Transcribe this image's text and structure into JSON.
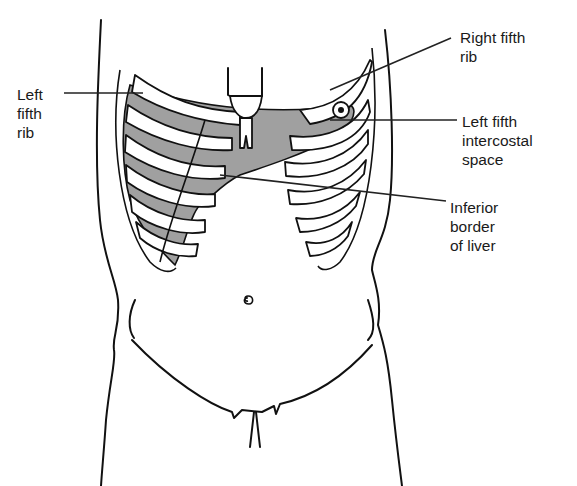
{
  "figure": {
    "caption_fragment": "...ing ... ... ... ... ... ... ... ...ys...ed",
    "labels": {
      "left_fifth_rib": "Left\nfifth\nrib",
      "right_fifth_rib": "Right fifth\nrib",
      "left_fifth_intercostal_space": "Left fifth\nintercostal\nspace",
      "inferior_border_of_liver": "Inferior\nborder\nof liver"
    },
    "colors": {
      "liver_shading": "#a0a0a0",
      "outline": "#111111",
      "background": "#ffffff"
    }
  }
}
